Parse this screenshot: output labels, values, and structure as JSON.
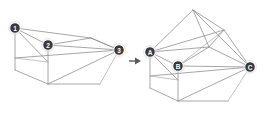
{
  "diagram": {
    "background_color": "#ffffff",
    "edge_color": "#8f8f94",
    "node_fill_color": "#3a3a3c",
    "node_label_color": "#ffffff",
    "arrow_color": "#5a5a5e",
    "left_figure": {
      "name": "source-polyhedron",
      "labels": [
        {
          "id": "n1",
          "text": "1",
          "x": 15,
          "y": 28
        },
        {
          "id": "n2",
          "text": "2",
          "x": 48,
          "y": 45
        },
        {
          "id": "n3",
          "text": "3",
          "x": 119,
          "y": 50
        }
      ]
    },
    "arrow": {
      "name": "transform-arrow",
      "direction": "right",
      "x": 128,
      "y": 61
    },
    "right_figure": {
      "name": "result-polyhedron",
      "labels": [
        {
          "id": "nA",
          "text": "A",
          "x": 150,
          "y": 52
        },
        {
          "id": "nB",
          "text": "B",
          "x": 178,
          "y": 66
        },
        {
          "id": "nC",
          "text": "C",
          "x": 250,
          "y": 67
        }
      ]
    }
  }
}
